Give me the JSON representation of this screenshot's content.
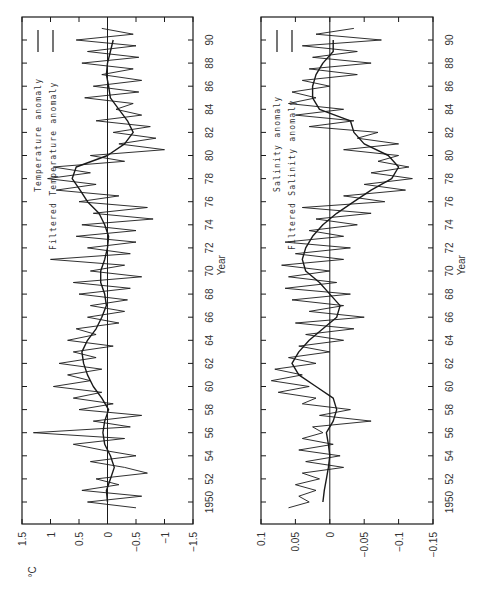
{
  "figure": {
    "orientation": "rotated-90-ccw",
    "ink_color": "#1a1a1a",
    "background": "#ffffff"
  },
  "chart_data": [
    {
      "type": "line",
      "title": "",
      "xlabel": "Year",
      "ylabel": "°C",
      "xlim": [
        1948.1,
        1991.7
      ],
      "ylim": [
        -1.5,
        1.5
      ],
      "x_ticks": [
        "1950",
        "52",
        "54",
        "56",
        "58",
        "60",
        "62",
        "64",
        "66",
        "68",
        "70",
        "72",
        "74",
        "76",
        "78",
        "80",
        "82",
        "84",
        "86",
        "88",
        "90"
      ],
      "y_ticks": [
        "1.5",
        "1",
        "0.5",
        "0",
        "−0.5",
        "−1",
        "−1.5"
      ],
      "y_tick_values": [
        1.5,
        1,
        0.5,
        0,
        -0.5,
        -1,
        -1.5
      ],
      "zero_line": true,
      "grid": false,
      "legend": [
        "Temperature anomaly",
        "Filtered Temperature anomaly"
      ],
      "legend_position": "upper-left (rotated)",
      "series": [
        {
          "name": "Filtered Temperature anomaly",
          "x": [
            1950,
            1951,
            1952,
            1953,
            1954,
            1955,
            1956,
            1957,
            1958,
            1959,
            1960,
            1961,
            1962,
            1963,
            1964,
            1965,
            1966,
            1967,
            1968,
            1969,
            1970,
            1971,
            1972,
            1973,
            1974,
            1975,
            1976,
            1977,
            1978,
            1979,
            1980,
            1981,
            1982,
            1983,
            1984,
            1985,
            1986,
            1987,
            1988,
            1989,
            1990
          ],
          "values": [
            0.0,
            0.02,
            -0.05,
            -0.12,
            -0.05,
            0.05,
            0.08,
            0.05,
            -0.02,
            0.1,
            0.25,
            0.35,
            0.42,
            0.45,
            0.35,
            0.2,
            0.1,
            0.02,
            0.05,
            0.12,
            0.12,
            0.05,
            0.0,
            -0.02,
            0.05,
            0.15,
            0.35,
            0.48,
            0.62,
            0.55,
            0.0,
            -0.3,
            -0.45,
            -0.35,
            -0.2,
            -0.05,
            -0.02,
            0.02,
            0.0,
            -0.05,
            -0.1
          ]
        },
        {
          "name": "Temperature anomaly",
          "x": [
            1949.5,
            1950,
            1950.5,
            1951,
            1951.5,
            1952,
            1952.5,
            1953,
            1953.5,
            1954,
            1954.5,
            1955,
            1955.5,
            1956,
            1956.5,
            1957,
            1957.5,
            1958,
            1958.5,
            1959,
            1959.5,
            1960,
            1960.5,
            1961,
            1961.5,
            1962,
            1962.5,
            1963,
            1963.5,
            1964,
            1964.5,
            1965,
            1965.5,
            1966,
            1966.5,
            1967,
            1967.5,
            1968,
            1968.5,
            1969,
            1969.5,
            1970,
            1970.5,
            1971,
            1971.5,
            1972,
            1972.5,
            1973,
            1973.5,
            1974,
            1974.5,
            1975,
            1975.5,
            1976,
            1976.5,
            1977,
            1977.5,
            1978,
            1978.5,
            1979,
            1979.5,
            1980,
            1980.5,
            1981,
            1981.5,
            1982,
            1982.5,
            1983,
            1983.5,
            1984,
            1984.5,
            1985,
            1985.5,
            1986,
            1986.5,
            1987,
            1987.5,
            1988,
            1988.5,
            1989,
            1989.5,
            1990,
            1990.5,
            1991
          ],
          "values": [
            -0.5,
            0.35,
            -0.6,
            0.45,
            -0.2,
            0.2,
            -0.7,
            -0.3,
            0.3,
            -0.5,
            0.1,
            0.6,
            -0.3,
            1.3,
            -0.4,
            0.25,
            -0.6,
            0.5,
            -0.1,
            0.6,
            0.1,
            0.95,
            0.3,
            0.7,
            0.1,
            0.85,
            0.2,
            0.6,
            -0.1,
            0.7,
            0.2,
            0.55,
            -0.2,
            0.35,
            -0.3,
            0.3,
            -0.35,
            0.5,
            -0.4,
            0.6,
            -0.6,
            0.3,
            -0.3,
            1.0,
            -0.4,
            0.35,
            -0.5,
            0.55,
            -0.5,
            0.45,
            -0.8,
            0.25,
            -0.7,
            0.5,
            -0.2,
            0.9,
            0.2,
            1.05,
            0.3,
            0.95,
            -0.3,
            0.3,
            -1.0,
            -0.2,
            -0.85,
            -0.1,
            -0.75,
            0.2,
            -0.6,
            -0.15,
            -0.45,
            0.4,
            -0.55,
            0.25,
            -0.6,
            0.1,
            -0.45,
            0.45,
            -0.55,
            0.35,
            -0.5,
            0.55,
            -0.45,
            0.1
          ]
        }
      ]
    },
    {
      "type": "line",
      "title": "",
      "xlabel": "Year",
      "ylabel": "",
      "xlim": [
        1948.1,
        1991.7
      ],
      "ylim": [
        -0.15,
        0.1
      ],
      "x_ticks": [
        "1950",
        "52",
        "54",
        "56",
        "58",
        "60",
        "62",
        "64",
        "66",
        "68",
        "70",
        "72",
        "74",
        "76",
        "78",
        "80",
        "82",
        "84",
        "86",
        "88",
        "90"
      ],
      "y_ticks": [
        "0.1",
        "0.05",
        "0",
        "−0.05",
        "−0.1",
        "−0.15"
      ],
      "y_tick_values": [
        0.1,
        0.05,
        0,
        -0.05,
        -0.1,
        -0.15
      ],
      "zero_line": true,
      "grid": false,
      "legend": [
        "Salinity anomaly",
        "Filtered Salinity anomaly"
      ],
      "legend_position": "upper-left (rotated)",
      "series": [
        {
          "name": "Filtered Salinity anomaly",
          "x": [
            1950,
            1951,
            1952,
            1953,
            1954,
            1955,
            1956,
            1957,
            1958,
            1959,
            1960,
            1961,
            1962,
            1963,
            1964,
            1965,
            1966,
            1967,
            1968,
            1969,
            1970,
            1971,
            1972,
            1973,
            1974,
            1975,
            1976,
            1977,
            1978,
            1979,
            1980,
            1981,
            1982,
            1983,
            1984,
            1985,
            1986,
            1987,
            1988,
            1989,
            1990
          ],
          "values": [
            0.01,
            0.008,
            0.005,
            0.002,
            0.0,
            0.002,
            0.005,
            -0.005,
            -0.01,
            -0.005,
            0.02,
            0.045,
            0.055,
            0.045,
            0.03,
            0.01,
            -0.01,
            -0.015,
            0.0,
            0.015,
            0.035,
            0.04,
            0.035,
            0.025,
            0.01,
            -0.01,
            -0.035,
            -0.06,
            -0.09,
            -0.1,
            -0.085,
            -0.05,
            -0.035,
            -0.03,
            0.015,
            0.025,
            0.025,
            0.02,
            0.01,
            -0.005,
            -0.005
          ]
        },
        {
          "name": "Salinity anomaly",
          "x": [
            1949.5,
            1950,
            1950.5,
            1951,
            1951.5,
            1952,
            1952.5,
            1953,
            1953.5,
            1954,
            1954.5,
            1955,
            1955.5,
            1956,
            1956.5,
            1957,
            1957.5,
            1958,
            1958.5,
            1959,
            1959.5,
            1960,
            1960.5,
            1961,
            1961.5,
            1962,
            1962.5,
            1963,
            1963.5,
            1964,
            1964.5,
            1965,
            1965.5,
            1966,
            1966.5,
            1967,
            1967.5,
            1968,
            1968.5,
            1969,
            1969.5,
            1970,
            1970.5,
            1971,
            1971.5,
            1972,
            1972.5,
            1973,
            1973.5,
            1974,
            1974.5,
            1975,
            1975.5,
            1976,
            1976.5,
            1977,
            1977.5,
            1978,
            1978.5,
            1979,
            1979.5,
            1980,
            1980.5,
            1981,
            1981.5,
            1982,
            1982.5,
            1983,
            1983.5,
            1984,
            1984.5,
            1985,
            1985.5,
            1986,
            1986.5,
            1987,
            1987.5,
            1988,
            1988.5,
            1989,
            1989.5,
            1990,
            1990.5,
            1991
          ],
          "values": [
            0.06,
            0.03,
            0.045,
            0.02,
            0.05,
            0.015,
            0.04,
            -0.02,
            0.035,
            -0.015,
            0.045,
            -0.005,
            0.04,
            0.01,
            0.025,
            -0.06,
            0.015,
            -0.03,
            0.04,
            0.02,
            0.075,
            0.03,
            0.085,
            0.04,
            0.08,
            0.02,
            0.06,
            0.0,
            0.045,
            -0.02,
            0.035,
            -0.035,
            0.05,
            -0.05,
            0.03,
            -0.02,
            0.055,
            -0.03,
            0.065,
            -0.01,
            0.06,
            0.0,
            0.07,
            -0.02,
            0.05,
            -0.03,
            0.065,
            -0.02,
            0.03,
            -0.04,
            0.02,
            -0.06,
            0.04,
            -0.08,
            -0.02,
            -0.11,
            -0.05,
            -0.12,
            -0.06,
            -0.115,
            -0.07,
            -0.1,
            -0.02,
            -0.1,
            -0.04,
            -0.07,
            0.03,
            -0.035,
            0.05,
            -0.02,
            0.06,
            0.02,
            0.055,
            0.0,
            0.04,
            -0.04,
            0.03,
            -0.06,
            0.025,
            -0.04,
            0.04,
            -0.075,
            0.02,
            -0.035
          ]
        }
      ]
    }
  ]
}
